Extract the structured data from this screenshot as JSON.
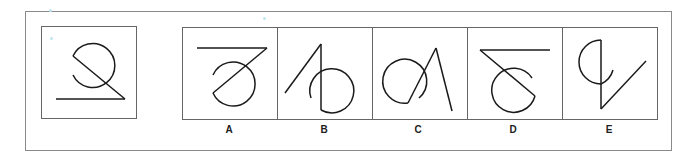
{
  "puzzle": {
    "question_figure": "circle-with-diagonal-and-horizontal-line",
    "options": [
      {
        "label": "A"
      },
      {
        "label": "B"
      },
      {
        "label": "C"
      },
      {
        "label": "D"
      },
      {
        "label": "E"
      }
    ]
  },
  "colors": {
    "stroke": "#1a1a1a",
    "border": "#666666"
  }
}
